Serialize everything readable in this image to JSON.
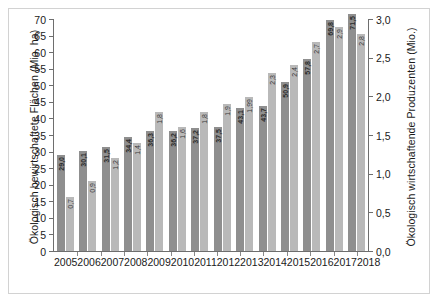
{
  "chart_data": {
    "type": "bar",
    "title": "",
    "subtitle": "",
    "xlabel": "",
    "ylabel": "Ökologisch bewirtschaftete Flächen (Mio. ha)",
    "y2label": "Ökologisch wirtschaftende Produzenten (Mio.)",
    "categories": [
      "2005",
      "2006",
      "2007",
      "2008",
      "2009",
      "2010",
      "2011",
      "2012",
      "2013",
      "2014",
      "2015",
      "2016",
      "2017",
      "2018"
    ],
    "series": [
      {
        "name": "Ökologisch bewirtschaftete Flächen (Mio. ha)",
        "axis": "left",
        "color": "#8f8f8f",
        "values": [
          29.0,
          30.1,
          31.5,
          34.4,
          36.3,
          36.2,
          37.2,
          37.5,
          43.1,
          43.7,
          50.9,
          57.8,
          69.8,
          71.5
        ],
        "labels": [
          "29,0",
          "30,1",
          "31,5",
          "34,4",
          "36,3",
          "36,2",
          "37,2",
          "37,5",
          "43,1",
          "43,7",
          "50,9",
          "57,8",
          "69,8",
          "71,5"
        ]
      },
      {
        "name": "Ökologisch wirtschaftende Produzenten (Mio.)",
        "axis": "right",
        "color": "#b9b9b9",
        "values": [
          0.7,
          0.9,
          1.2,
          1.4,
          1.8,
          1.6,
          1.8,
          1.9,
          1.99,
          2.3,
          2.4,
          2.7,
          2.9,
          2.8
        ],
        "labels": [
          "0,7",
          "0,9",
          "1,2",
          "1,4",
          "1,8",
          "1,6",
          "1,8",
          "1,9",
          "1,99",
          "2,3",
          "2,4",
          "2,7",
          "2,9",
          "2,8"
        ]
      }
    ],
    "ylim": [
      0,
      70
    ],
    "y2lim": [
      0,
      3.0
    ],
    "yticks": [
      0,
      5,
      10,
      15,
      20,
      25,
      30,
      35,
      40,
      45,
      50,
      55,
      60,
      65,
      70
    ],
    "ytick_labels": [
      "0",
      "5",
      "10",
      "15",
      "20",
      "25",
      "30",
      "35",
      "40",
      "45",
      "50",
      "55",
      "60",
      "65",
      "70"
    ],
    "y2ticks": [
      0,
      0.5,
      1.0,
      1.5,
      2.0,
      2.5,
      3.0
    ],
    "y2tick_labels": [
      "0,0",
      "0,5",
      "1,0",
      "1,5",
      "2,0",
      "2,5",
      "3,0"
    ],
    "grid": false,
    "legend": "none"
  }
}
